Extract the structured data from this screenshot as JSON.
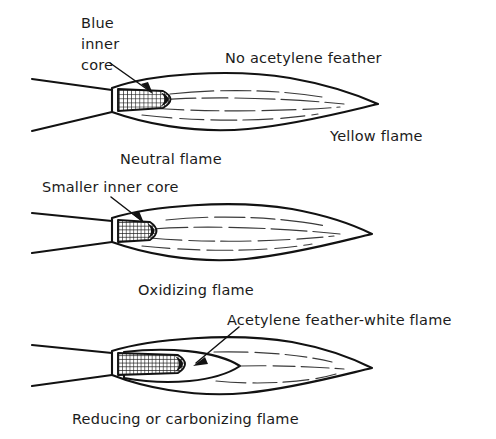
{
  "figure": {
    "background_color": "#ffffff",
    "line_color": "#121212",
    "text_color": "#1b1b1b"
  },
  "diagrams": [
    {
      "id": "neutral",
      "caption": "Neutral flame",
      "core_label_line1": "Blue",
      "core_label_line2": "inner",
      "core_label_line3": "core",
      "feather_label": "No acetylene feather",
      "outer_label": "Yellow flame",
      "core_description": "cross-hatched blue inner cone",
      "core_length_px": 62,
      "envelope_tip_x": 378
    },
    {
      "id": "oxidizing",
      "caption": "Oxidizing flame",
      "core_label": "Smaller inner core",
      "core_description": "short cross-hatched inner cone with dark tip",
      "core_length_px": 46,
      "envelope_tip_x": 372
    },
    {
      "id": "reducing",
      "caption": "Reducing or carbonizing flame",
      "feather_label": "Acetylene feather-white flame",
      "core_description": "long cross-hatched inner cone with dark tip plus acetylene feather",
      "core_length_px": 78,
      "envelope_tip_x": 372
    }
  ]
}
